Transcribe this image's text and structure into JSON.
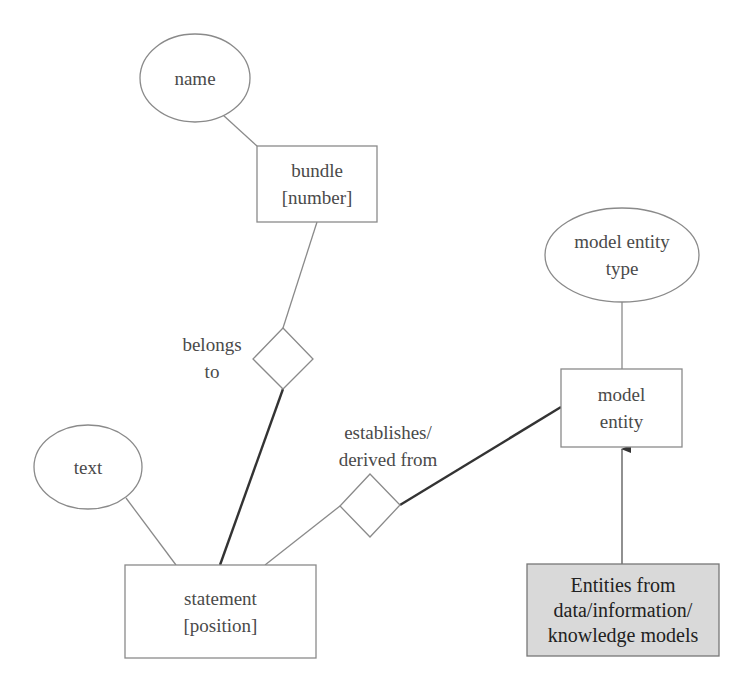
{
  "diagram": {
    "type": "entity-relationship",
    "colors": {
      "stroke": "#8a8a8a",
      "thick_stroke": "#333333",
      "text": "#4a4a4a",
      "shaded_fill": "#d9d9d9",
      "shaded_text": "#222222"
    },
    "attributes": {
      "name": {
        "label": "name"
      },
      "text": {
        "label": "text"
      },
      "model_entity_type": {
        "line1": "model entity",
        "line2": "type"
      }
    },
    "entities": {
      "bundle": {
        "line1": "bundle",
        "line2": "[number]"
      },
      "statement": {
        "line1": "statement",
        "line2": "[position]"
      },
      "model_entity": {
        "line1": "model",
        "line2": "entity"
      },
      "external": {
        "line1": "Entities from",
        "line2": "data/information/",
        "line3": "knowledge models"
      }
    },
    "relationships": {
      "belongs_to": {
        "line1": "belongs",
        "line2": "to"
      },
      "establishes": {
        "line1": "establishes/",
        "line2": "derived from"
      }
    },
    "connections": [
      {
        "from": "name",
        "to": "bundle",
        "style": "thin"
      },
      {
        "from": "bundle",
        "to": "belongs_to",
        "style": "thin"
      },
      {
        "from": "belongs_to",
        "to": "statement",
        "style": "thick"
      },
      {
        "from": "text",
        "to": "statement",
        "style": "thin"
      },
      {
        "from": "statement",
        "to": "establishes",
        "style": "thin"
      },
      {
        "from": "establishes",
        "to": "model_entity",
        "style": "thick"
      },
      {
        "from": "model_entity_type",
        "to": "model_entity",
        "style": "thin"
      },
      {
        "from": "external",
        "to": "model_entity",
        "style": "arrow"
      }
    ]
  }
}
